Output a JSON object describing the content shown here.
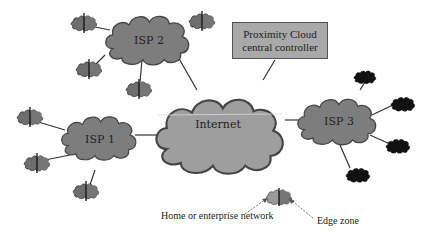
{
  "diagram": {
    "controller": {
      "line1": "Proximity Cloud",
      "line2": "central controller"
    },
    "internet": {
      "label": "Internet"
    },
    "isps": [
      {
        "id": "isp1",
        "label": "ISP 1"
      },
      {
        "id": "isp2",
        "label": "ISP 2"
      },
      {
        "id": "isp3",
        "label": "ISP 3"
      }
    ],
    "legend": {
      "home_label": "Home or enterprise network",
      "edge_label": "Edge zone"
    },
    "colors": {
      "internet_fill": "#9e9e9e",
      "isp_fill": "#7d7d7d",
      "edge_dark": "#111111",
      "controller_fill": "#a9a9a9",
      "outline": "#444444"
    }
  }
}
